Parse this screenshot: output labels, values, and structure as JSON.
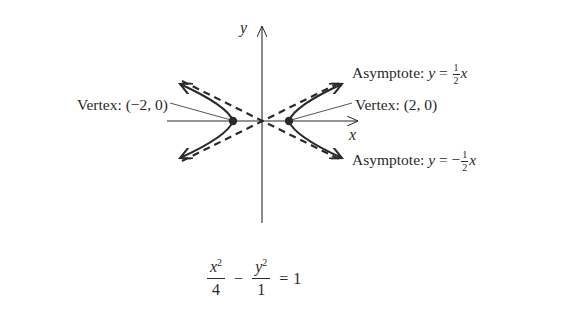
{
  "diagram": {
    "type": "hyperbola-graph",
    "axes": {
      "x_label": "x",
      "y_label": "y"
    },
    "labels": {
      "asymptote_positive": {
        "prefix": "Asymptote: ",
        "var": "y",
        "equals": " = ",
        "sign": "",
        "frac_num": "1",
        "frac_den": "2",
        "suffix_var": "x"
      },
      "asymptote_negative": {
        "prefix": "Asymptote: ",
        "var": "y",
        "equals": " = ",
        "sign": "−",
        "frac_num": "1",
        "frac_den": "2",
        "suffix_var": "x"
      },
      "vertex_left": "Vertex: (−2, 0)",
      "vertex_right": "Vertex: (2, 0)"
    },
    "equation": {
      "term1_num_var": "x",
      "term1_num_exp": "2",
      "term1_den": "4",
      "operator": "−",
      "term2_num_var": "y",
      "term2_num_exp": "2",
      "term2_den": "1",
      "equals": "=",
      "rhs": "1"
    },
    "math": {
      "a": 2,
      "b": 1,
      "vertices": [
        [
          -2,
          0
        ],
        [
          2,
          0
        ]
      ],
      "asymptote_slopes": [
        0.5,
        -0.5
      ]
    },
    "colors": {
      "ink": "#2a2a2a",
      "background": "#ffffff"
    }
  }
}
